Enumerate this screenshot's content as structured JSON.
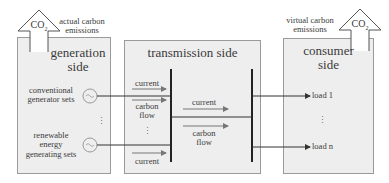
{
  "generation": {
    "title_line1": "generation",
    "title_line2": "side",
    "emission_label_line1": "actual carbon",
    "emission_label_line2": "emissions",
    "co2": "CO",
    "co2_sub": "2",
    "conventional_line1": "conventional",
    "conventional_line2": "generator sets",
    "renewable_line1": "renewable",
    "renewable_line2": "energy",
    "renewable_line3": "generating sets",
    "ellipsis": "⋮"
  },
  "transmission": {
    "title": "transmission side",
    "current_top": "current",
    "carbon_flow_left_line1": "carbon",
    "carbon_flow_left_line2": "flow",
    "ellipsis": "⋮",
    "current_bottom": "current",
    "current_middle": "current",
    "carbon_flow_right_line1": "carbon",
    "carbon_flow_right_line2": "flow"
  },
  "consumer": {
    "title_line1": "consumer",
    "title_line2": "side",
    "emission_label_line1": "virtual carbon",
    "emission_label_line2": "emissions",
    "co2": "CO",
    "co2_sub": "2",
    "load1": "load 1",
    "ellipsis": "⋮",
    "loadn": "load n"
  }
}
